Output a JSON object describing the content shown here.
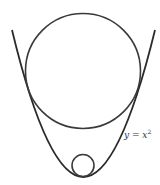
{
  "diagram": {
    "label": {
      "y_var": "y",
      "equals": " = ",
      "x_var": "x",
      "exponent": "2"
    },
    "colors": {
      "stroke": "#2a2a2a",
      "background": "#ffffff"
    },
    "parabola": {
      "vertex": [
        83,
        177
      ],
      "left_top": [
        12,
        30
      ],
      "right_top": [
        155,
        30
      ]
    },
    "big_circle": {
      "cx": 83,
      "cy": 71,
      "r": 57.5
    },
    "small_circle": {
      "cx": 83,
      "cy": 165,
      "r": 11
    }
  }
}
